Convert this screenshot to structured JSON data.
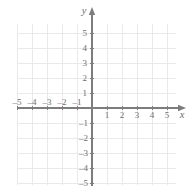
{
  "figure": {
    "kind": "cartesian-coordinate-grid",
    "background_color": "#ffffff",
    "grid_color": "#e9e9e9",
    "axis_color": "#7d7d7d",
    "label_color": "#6e6e6e"
  },
  "axes": {
    "x_label": "x",
    "y_label": "y",
    "origin_px": {
      "x": 92,
      "y": 108
    },
    "unit_px": 15,
    "x_axis_line": {
      "x1": 18,
      "x2": 181,
      "y": 108
    },
    "y_axis_line": {
      "x": 92,
      "y1": 12,
      "y2": 186
    }
  },
  "chart_data": {
    "type": "scatter",
    "title": "",
    "subtitle": "",
    "xlabel": "x",
    "ylabel": "y",
    "xlim": [
      -5.6,
      5.6
    ],
    "ylim": [
      -5.6,
      5.6
    ],
    "xticks": [
      -5,
      -4,
      -3,
      -2,
      -1,
      1,
      2,
      3,
      4,
      5
    ],
    "yticks": [
      5,
      4,
      3,
      2,
      1,
      -1,
      -2,
      -3,
      -4,
      -5
    ],
    "xtick_labels": [
      "–5",
      "–4",
      "–3",
      "–2",
      "–1",
      "1",
      "2",
      "3",
      "4",
      "5"
    ],
    "ytick_labels": [
      "5",
      "4",
      "3",
      "2",
      "1",
      "–1",
      "–2",
      "–3",
      "–4",
      "–5"
    ],
    "grid": true,
    "grid_minor": false,
    "legend": null,
    "legend_position": "none",
    "annotations": [],
    "series": [],
    "x": [],
    "y": [],
    "values": [],
    "categories": []
  },
  "x_tick_labels": {
    "negative": [
      {
        "value": -5,
        "text": "–5"
      },
      {
        "value": -4,
        "text": "–4"
      },
      {
        "value": -3,
        "text": "–3"
      },
      {
        "value": -2,
        "text": "–2"
      },
      {
        "value": -1,
        "text": "–1"
      }
    ],
    "positive": [
      {
        "value": 1,
        "text": "1"
      },
      {
        "value": 2,
        "text": "2"
      },
      {
        "value": 3,
        "text": "3"
      },
      {
        "value": 4,
        "text": "4"
      },
      {
        "value": 5,
        "text": "5"
      }
    ]
  },
  "y_tick_labels": {
    "positive": [
      {
        "value": 5,
        "text": "5"
      },
      {
        "value": 4,
        "text": "4"
      },
      {
        "value": 3,
        "text": "3"
      },
      {
        "value": 2,
        "text": "2"
      },
      {
        "value": 1,
        "text": "1"
      }
    ],
    "negative": [
      {
        "value": -1,
        "text": "–1"
      },
      {
        "value": -2,
        "text": "–2"
      },
      {
        "value": -3,
        "text": "–3"
      },
      {
        "value": -4,
        "text": "–4"
      },
      {
        "value": -5,
        "text": "–5"
      }
    ]
  },
  "icons": {
    "x_arrow": "arrow-right-icon",
    "y_arrow": "arrow-up-icon"
  }
}
